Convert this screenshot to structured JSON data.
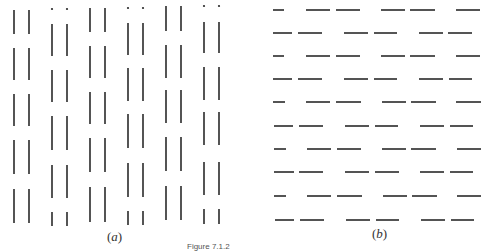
{
  "figure": {
    "caption": "Figure 7.1.2",
    "ink_color": "#2a2a2a",
    "panels": [
      {
        "id": "a",
        "label": "a",
        "orientation": "vertical",
        "description": "Columns of vertical line segments arranged in pairs; alternate pairs are offset by half a period (with dots at the top), forming grouping-by-proximity pattern",
        "pairs": [
          {
            "x": [
              14,
              29
            ],
            "offset": "aligned",
            "segments": [
              [
                10,
                34
              ],
              [
                48,
                80
              ],
              [
                94,
                126
              ],
              [
                140,
                174
              ],
              [
                189,
                223
              ]
            ]
          },
          {
            "x": [
              52,
              67
            ],
            "offset": "shifted",
            "dot_y": 9,
            "segments": [
              [
                24,
                56
              ],
              [
                70,
                102
              ],
              [
                116,
                150
              ],
              [
                165,
                198
              ],
              [
                212,
                226
              ]
            ]
          },
          {
            "x": [
              90,
              105
            ],
            "offset": "aligned",
            "segments": [
              [
                8,
                32
              ],
              [
                46,
                78
              ],
              [
                92,
                124
              ],
              [
                138,
                172
              ],
              [
                187,
                222
              ]
            ]
          },
          {
            "x": [
              128,
              143
            ],
            "offset": "shifted",
            "dot_y": 8,
            "segments": [
              [
                23,
                55
              ],
              [
                68,
                101
              ],
              [
                114,
                148
              ],
              [
                163,
                197
              ],
              [
                211,
                225
              ]
            ]
          },
          {
            "x": [
              166,
              181
            ],
            "offset": "aligned",
            "segments": [
              [
                6,
                31
              ],
              [
                45,
                78
              ],
              [
                90,
                123
              ],
              [
                137,
                171
              ],
              [
                186,
                220
              ]
            ]
          },
          {
            "x": [
              204,
              219
            ],
            "offset": "shifted",
            "dot_y": 6,
            "segments": [
              [
                22,
                53
              ],
              [
                67,
                100
              ],
              [
                112,
                145
              ],
              [
                162,
                195
              ],
              [
                209,
                224
              ]
            ]
          }
        ]
      },
      {
        "id": "b",
        "label": "b",
        "orientation": "horizontal",
        "description": "Rows of horizontal dash segments arranged in pairs; alternate rows are offset, forming grouping-by-proximity pattern",
        "rows": [
          {
            "y": 10,
            "type": "odd",
            "segments": [
              [
                273,
                284
              ],
              [
                306,
                330
              ],
              [
                336,
                360
              ],
              [
                381,
                405
              ],
              [
                410,
                435
              ],
              [
                456,
                480
              ]
            ]
          },
          {
            "y": 33,
            "type": "even",
            "segments": [
              [
                273,
                292
              ],
              [
                298,
                322
              ],
              [
                344,
                368
              ],
              [
                374,
                397
              ],
              [
                419,
                443
              ],
              [
                448,
                472
              ]
            ]
          },
          {
            "y": 56,
            "type": "odd",
            "segments": [
              [
                273,
                284
              ],
              [
                306,
                330
              ],
              [
                336,
                360
              ],
              [
                381,
                405
              ],
              [
                410,
                435
              ],
              [
                456,
                480
              ]
            ]
          },
          {
            "y": 79,
            "type": "even",
            "segments": [
              [
                273,
                292
              ],
              [
                298,
                322
              ],
              [
                344,
                368
              ],
              [
                374,
                397
              ],
              [
                419,
                443
              ],
              [
                449,
                472
              ]
            ]
          },
          {
            "y": 102,
            "type": "odd",
            "segments": [
              [
                273,
                285
              ],
              [
                306,
                330
              ],
              [
                336,
                361
              ],
              [
                382,
                406
              ],
              [
                411,
                436
              ],
              [
                456,
                481
              ]
            ]
          },
          {
            "y": 126,
            "type": "even",
            "segments": [
              [
                274,
                293
              ],
              [
                299,
                323
              ],
              [
                345,
                369
              ],
              [
                375,
                398
              ],
              [
                420,
                444
              ],
              [
                450,
                473
              ]
            ]
          },
          {
            "y": 149,
            "type": "odd",
            "segments": [
              [
                274,
                286
              ],
              [
                307,
                331
              ],
              [
                337,
                361
              ],
              [
                382,
                406
              ],
              [
                411,
                436
              ],
              [
                457,
                481
              ]
            ]
          },
          {
            "y": 172,
            "type": "even",
            "segments": [
              [
                274,
                294
              ],
              [
                299,
                323
              ],
              [
                345,
                369
              ],
              [
                375,
                399
              ],
              [
                420,
                444
              ],
              [
                450,
                473
              ]
            ]
          },
          {
            "y": 196,
            "type": "odd",
            "segments": [
              [
                274,
                286
              ],
              [
                307,
                331
              ],
              [
                337,
                362
              ],
              [
                383,
                407
              ],
              [
                412,
                437
              ],
              [
                457,
                481
              ]
            ]
          },
          {
            "y": 220,
            "type": "even",
            "segments": [
              [
                275,
                294
              ],
              [
                300,
                324
              ],
              [
                346,
                370
              ],
              [
                376,
                399
              ],
              [
                421,
                445
              ],
              [
                451,
                474
              ]
            ]
          }
        ]
      }
    ]
  }
}
